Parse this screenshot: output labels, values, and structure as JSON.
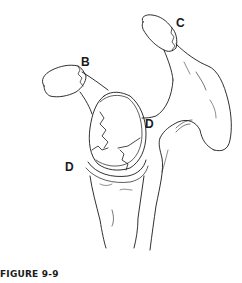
{
  "figure": {
    "caption": "FIGURE 9-9",
    "labels": [
      {
        "id": "B",
        "text": "B",
        "x": 81,
        "y": 56
      },
      {
        "id": "C",
        "text": "C",
        "x": 176,
        "y": 17
      },
      {
        "id": "D-right",
        "text": "D",
        "x": 145,
        "y": 118
      },
      {
        "id": "D-left",
        "text": "D",
        "x": 65,
        "y": 161
      }
    ],
    "colors": {
      "line": "#1a1a1a",
      "background": "#ffffff"
    }
  }
}
